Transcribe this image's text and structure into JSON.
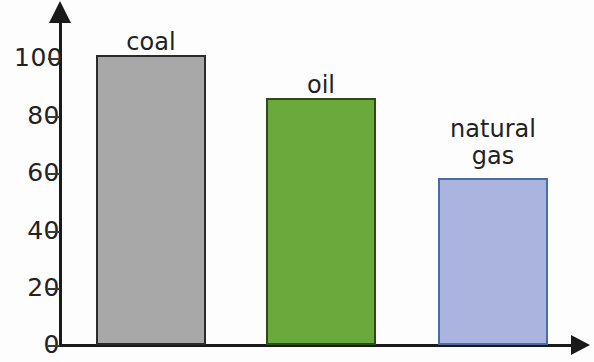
{
  "chart_data": {
    "type": "bar",
    "title": "",
    "subtitle": "",
    "xlabel": "",
    "ylabel": "",
    "categories": [
      "coal",
      "oil",
      "natural gas"
    ],
    "values": [
      101,
      86,
      58
    ],
    "ylim": [
      0,
      110
    ],
    "yticks": [
      0,
      20,
      40,
      60,
      80,
      100
    ],
    "ytick_labels": [
      "0",
      "20",
      "40",
      "60",
      "80",
      "100"
    ],
    "xticks": [],
    "xtick_labels": [],
    "grid": false,
    "legend": false,
    "legend_position": "none",
    "annotations": [],
    "bar_labels_inside_plot": true,
    "series": [
      {
        "name": "",
        "values": [
          101,
          86,
          58
        ]
      }
    ],
    "bars": [
      {
        "category": "coal",
        "label": "coal",
        "label_lines": [
          "coal"
        ],
        "value": 101,
        "fill_color": "#a8a8a8",
        "border_color": "#2b2b2b"
      },
      {
        "category": "oil",
        "label": "oil",
        "label_lines": [
          "oil"
        ],
        "value": 86,
        "fill_color": "#6aaa3c",
        "border_color": "#2f4a18"
      },
      {
        "category": "natural gas",
        "label": "natural\ngas",
        "label_lines": [
          "natural",
          "gas"
        ],
        "value": 58,
        "fill_color": "#aab4de",
        "border_color": "#4a6aa8"
      }
    ]
  },
  "axes": {
    "y_axis_name": "y-axis",
    "x_axis_name": "x-axis",
    "axis_color": "#1a1a1a",
    "tick_color": "#3a3a3a",
    "y_arrow": "arrow-up",
    "x_arrow": "arrow-right"
  },
  "canvas": {
    "background_color": "#fdfdfd",
    "width": 594,
    "height": 362
  }
}
